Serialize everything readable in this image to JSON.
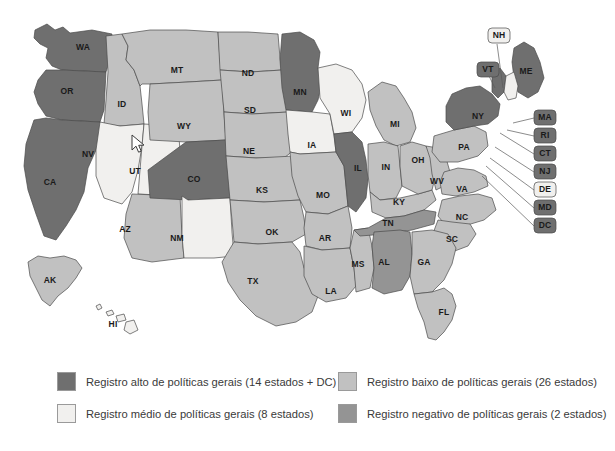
{
  "page": {
    "background": "#ffffff"
  },
  "colors": {
    "alto": "#6f6f6f",
    "medio": "#f1f0ee",
    "baixo": "#c1c1c1",
    "negativo": "#949494",
    "outline": "#4a4a4a",
    "label": "#1a1a1a",
    "legend_text": "#3a3a3a"
  },
  "legend": {
    "items": [
      {
        "id": "alto",
        "label": "Registro alto de políticas gerais (14 estados + DC)",
        "color": "#6f6f6f",
        "count": 14,
        "includes_dc": true,
        "row": 0,
        "col": 0
      },
      {
        "id": "baixo",
        "label": "Registro baixo de políticas gerais (26 estados)",
        "color": "#c1c1c1",
        "count": 26,
        "includes_dc": false,
        "row": 0,
        "col": 1
      },
      {
        "id": "medio",
        "label": "Registro médio de políticas gerais (8 estados)",
        "color": "#f1f0ee",
        "count": 8,
        "includes_dc": false,
        "row": 1,
        "col": 0
      },
      {
        "id": "negativo",
        "label": "Registro negativo de políticas gerais (2 estados)",
        "color": "#949494",
        "count": 2,
        "includes_dc": false,
        "row": 1,
        "col": 1
      }
    ]
  },
  "chart_data": {
    "type": "map",
    "projection": "us-albers-usa",
    "categories": [
      "alto",
      "medio",
      "baixo",
      "negativo"
    ],
    "category_labels": {
      "alto": "Registro alto de políticas gerais",
      "medio": "Registro médio de políticas gerais",
      "baixo": "Registro baixo de políticas gerais",
      "negativo": "Registro negativo de políticas gerais"
    },
    "category_counts": {
      "alto": 14,
      "medio": 8,
      "baixo": 26,
      "negativo": 2
    },
    "regions": [
      {
        "code": "WA",
        "category": "alto",
        "label_x": 83,
        "label_y": 48
      },
      {
        "code": "OR",
        "category": "alto",
        "label_x": 67,
        "label_y": 92
      },
      {
        "code": "CA",
        "category": "alto",
        "label_x": 50,
        "label_y": 183
      },
      {
        "code": "ID",
        "category": "baixo",
        "label_x": 122,
        "label_y": 105
      },
      {
        "code": "NV",
        "category": "medio",
        "label_x": 88,
        "label_y": 155
      },
      {
        "code": "UT",
        "category": "medio",
        "label_x": 135,
        "label_y": 172
      },
      {
        "code": "AZ",
        "category": "baixo",
        "label_x": 125,
        "label_y": 230
      },
      {
        "code": "MT",
        "category": "baixo",
        "label_x": 177,
        "label_y": 71
      },
      {
        "code": "WY",
        "category": "baixo",
        "label_x": 184,
        "label_y": 127
      },
      {
        "code": "CO",
        "category": "alto",
        "label_x": 194,
        "label_y": 180
      },
      {
        "code": "NM",
        "category": "medio",
        "label_x": 177,
        "label_y": 239
      },
      {
        "code": "ND",
        "category": "baixo",
        "label_x": 248,
        "label_y": 74
      },
      {
        "code": "SD",
        "category": "baixo",
        "label_x": 250,
        "label_y": 111
      },
      {
        "code": "NE",
        "category": "baixo",
        "label_x": 249,
        "label_y": 152
      },
      {
        "code": "KS",
        "category": "baixo",
        "label_x": 262,
        "label_y": 191
      },
      {
        "code": "OK",
        "category": "baixo",
        "label_x": 272,
        "label_y": 233
      },
      {
        "code": "TX",
        "category": "baixo",
        "label_x": 253,
        "label_y": 282
      },
      {
        "code": "MN",
        "category": "alto",
        "label_x": 300,
        "label_y": 93
      },
      {
        "code": "IA",
        "category": "medio",
        "label_x": 312,
        "label_y": 146
      },
      {
        "code": "MO",
        "category": "baixo",
        "label_x": 323,
        "label_y": 196
      },
      {
        "code": "AR",
        "category": "baixo",
        "label_x": 325,
        "label_y": 239
      },
      {
        "code": "LA",
        "category": "baixo",
        "label_x": 331,
        "label_y": 292
      },
      {
        "code": "WI",
        "category": "medio",
        "label_x": 346,
        "label_y": 114
      },
      {
        "code": "IL",
        "category": "alto",
        "label_x": 358,
        "label_y": 169
      },
      {
        "code": "MS",
        "category": "baixo",
        "label_x": 358,
        "label_y": 265
      },
      {
        "code": "MI",
        "category": "baixo",
        "label_x": 395,
        "label_y": 125
      },
      {
        "code": "IN",
        "category": "baixo",
        "label_x": 386,
        "label_y": 168
      },
      {
        "code": "KY",
        "category": "baixo",
        "label_x": 399,
        "label_y": 203
      },
      {
        "code": "TN",
        "category": "negativo",
        "label_x": 388,
        "label_y": 224
      },
      {
        "code": "AL",
        "category": "negativo",
        "label_x": 384,
        "label_y": 263
      },
      {
        "code": "OH",
        "category": "baixo",
        "label_x": 418,
        "label_y": 161
      },
      {
        "code": "WV",
        "category": "baixo",
        "label_x": 437,
        "label_y": 182
      },
      {
        "code": "VA",
        "category": "baixo",
        "label_x": 462,
        "label_y": 190
      },
      {
        "code": "NC",
        "category": "baixo",
        "label_x": 462,
        "label_y": 218
      },
      {
        "code": "SC",
        "category": "baixo",
        "label_x": 452,
        "label_y": 240
      },
      {
        "code": "GA",
        "category": "baixo",
        "label_x": 424,
        "label_y": 263
      },
      {
        "code": "FL",
        "category": "baixo",
        "label_x": 444,
        "label_y": 313
      },
      {
        "code": "PA",
        "category": "baixo",
        "label_x": 464,
        "label_y": 148
      },
      {
        "code": "NY",
        "category": "alto",
        "label_x": 478,
        "label_y": 117
      },
      {
        "code": "ME",
        "category": "alto",
        "label_x": 526,
        "label_y": 72
      },
      {
        "code": "AK",
        "category": "baixo",
        "label_x": 50,
        "label_y": 281
      },
      {
        "code": "HI",
        "category": "medio",
        "label_x": 113,
        "label_y": 325
      }
    ],
    "callouts": [
      {
        "code": "NH",
        "category": "medio",
        "box_x": 488,
        "box_y": 28,
        "line_x1": 497,
        "line_y1": 44,
        "line_x2": 503,
        "line_y2": 88
      },
      {
        "code": "VT",
        "category": "alto",
        "box_x": 477,
        "box_y": 62,
        "line_x1": 489,
        "line_y1": 76,
        "line_x2": 495,
        "line_y2": 88
      },
      {
        "code": "MA",
        "category": "alto",
        "box_x": 534,
        "box_y": 110,
        "line_x1": 534,
        "line_y1": 118,
        "line_x2": 513,
        "line_y2": 123
      },
      {
        "code": "RI",
        "category": "alto",
        "box_x": 534,
        "box_y": 128,
        "line_x1": 534,
        "line_y1": 136,
        "line_x2": 507,
        "line_y2": 130
      },
      {
        "code": "CT",
        "category": "alto",
        "box_x": 534,
        "box_y": 146,
        "line_x1": 534,
        "line_y1": 154,
        "line_x2": 500,
        "line_y2": 133
      },
      {
        "code": "NJ",
        "category": "alto",
        "box_x": 534,
        "box_y": 164,
        "line_x1": 534,
        "line_y1": 172,
        "line_x2": 495,
        "line_y2": 147
      },
      {
        "code": "DE",
        "category": "medio",
        "box_x": 534,
        "box_y": 182,
        "line_x1": 534,
        "line_y1": 190,
        "line_x2": 490,
        "line_y2": 158
      },
      {
        "code": "MD",
        "category": "alto",
        "box_x": 534,
        "box_y": 200,
        "line_x1": 534,
        "line_y1": 208,
        "line_x2": 486,
        "line_y2": 166
      },
      {
        "code": "DC",
        "category": "alto",
        "box_x": 534,
        "box_y": 218,
        "line_x1": 534,
        "line_y1": 226,
        "line_x2": 482,
        "line_y2": 176
      }
    ]
  },
  "cursor": {
    "x": 131,
    "y": 134,
    "icon": "mouse-pointer-icon"
  }
}
